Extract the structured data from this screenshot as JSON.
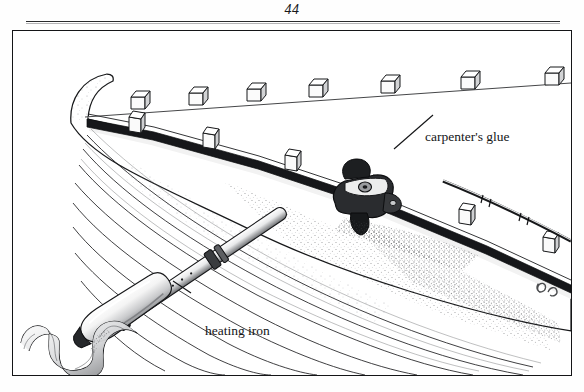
{
  "page": {
    "folio": "44",
    "rule": true
  },
  "figure": {
    "labels": [
      {
        "id": "glue",
        "text": "carpenter's glue",
        "x": 412,
        "y": 98,
        "leader": {
          "x1": 432,
          "y1": 114,
          "x2": 393,
          "y2": 148
        }
      },
      {
        "id": "iron",
        "text": "heating iron",
        "x": 192,
        "y": 292,
        "leader": {
          "x1": 188,
          "y1": 290,
          "x2": 168,
          "y2": 278
        }
      }
    ],
    "signature": "artist-monogram",
    "colors": {
      "ink": "#141517",
      "line": "#2a2b2d",
      "paper": "#fefefe",
      "shade": "#8c8e92",
      "dark_rail": "#16171a"
    },
    "elements": {
      "upper_block_row_count": 7,
      "gunwale_block_row_count": 6,
      "hull_strake_count": 9,
      "tool": "heating-iron-with-coiled-cord"
    }
  }
}
